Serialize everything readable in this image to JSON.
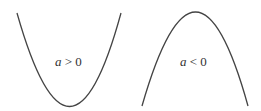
{
  "diagram": {
    "title": "",
    "stroke_color": "#444444",
    "panels": [
      {
        "name": "upward-parabola",
        "label_var": "a",
        "label_rest": " > 0",
        "opens": "up"
      },
      {
        "name": "downward-parabola",
        "label_var": "a",
        "label_rest": " < 0",
        "opens": "down"
      }
    ]
  }
}
